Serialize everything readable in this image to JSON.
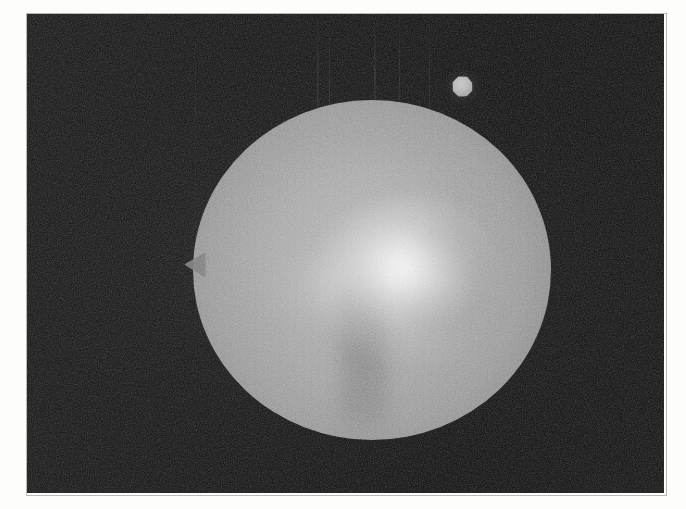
{
  "image": {
    "kind": "astronomical-plate",
    "caption": "",
    "frame": {
      "x": 27,
      "y": 14,
      "width": 637,
      "height": 479
    },
    "background_color": "#0d0d0d",
    "border_color": "#b9b9b4",
    "page_color": "#fdfdfb"
  },
  "objects": {
    "primary": {
      "name": "Primary disk",
      "shape": "sphere",
      "center_x": 345,
      "center_y": 256,
      "radius_x": 179,
      "radius_y": 170,
      "peak_brightness_color": "#ffffff",
      "limb_color": "#6a6a6a",
      "mean_color": "#9e9e9e",
      "core": {
        "center_x": 345,
        "center_y": 235,
        "color": "#ffffff"
      },
      "secondary_lobe": {
        "center_x": 305,
        "center_y": 274,
        "color": "#e8e8e8"
      },
      "limb_feature": {
        "name": "left limb spur",
        "x": 158,
        "y": 266
      }
    },
    "satellite": {
      "name": "Satellite",
      "shape": "hexagonal-blob",
      "center_x": 462,
      "center_y": 86,
      "diameter": 21,
      "color": "#bdbdbd"
    }
  },
  "artifacts": {
    "grain": "film-grain noise",
    "streaks": "vertical scan streaks",
    "streak_positions_x": [
      318,
      330,
      375,
      400,
      430
    ]
  },
  "icons": {
    "primary_disk": "sphere-icon",
    "satellite": "moon-icon"
  }
}
